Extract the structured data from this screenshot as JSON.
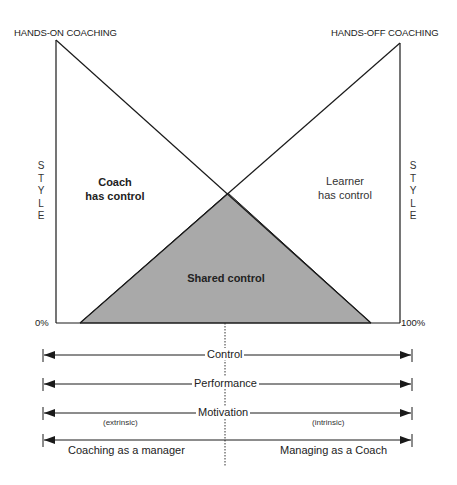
{
  "diagram": {
    "top_labels": {
      "left": "HANDS-ON COACHING",
      "right": "HANDS-OFF COACHING"
    },
    "side_labels": {
      "left": "S\nT\nY\nL\nE",
      "right": "S\nT\nY\nL\nE"
    },
    "axis": {
      "min": "0%",
      "max": "100%"
    },
    "regions": {
      "coach": [
        "Coach",
        "has control"
      ],
      "learner": [
        "Learner",
        "has control"
      ],
      "shared": "Shared control"
    },
    "arrows": [
      {
        "label": "Control"
      },
      {
        "label": "Performance"
      },
      {
        "label": "Motivation",
        "left_note": "(extrinsic)",
        "right_note": "(intrinsic)"
      },
      {
        "label": "",
        "left_caption": "Coaching as a manager",
        "right_caption": "Managing as a Coach"
      }
    ],
    "colors": {
      "line": "#1a1a1a",
      "shared_fill": "#a9a9a9"
    }
  }
}
